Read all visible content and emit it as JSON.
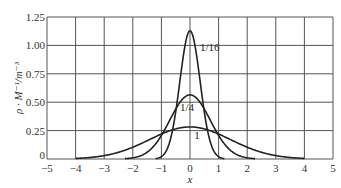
{
  "chart_data": {
    "type": "line",
    "title": "",
    "xlabel": "x",
    "ylabel": "ρ · M⁻¹/m⁻³",
    "xlim": [
      -5,
      5
    ],
    "ylim": [
      0,
      1.25
    ],
    "grid": true,
    "x_ticks": [
      "−5",
      "−4",
      "−3",
      "−2",
      "−1",
      "0",
      "1",
      "2",
      "3",
      "4",
      "5"
    ],
    "y_ticks": [
      "0",
      "0.25",
      "0.50",
      "0.75",
      "1.00",
      "1.25"
    ],
    "x": [
      -4,
      -3.5,
      -3,
      -2.5,
      -2,
      -1.75,
      -1.5,
      -1.25,
      -1,
      -0.75,
      -0.5,
      -0.25,
      0,
      0.25,
      0.5,
      0.75,
      1,
      1.25,
      1.5,
      1.75,
      2,
      2.5,
      3,
      3.5,
      4
    ],
    "series": [
      {
        "name": "1/16",
        "label": "1/16",
        "peak": 1.13,
        "values": [
          0,
          0,
          0,
          0,
          0,
          0,
          0,
          0.001,
          0.02,
          0.12,
          0.41,
          0.83,
          1.13,
          0.83,
          0.41,
          0.12,
          0.02,
          0.001,
          0,
          0,
          0,
          0,
          0,
          0,
          0
        ]
      },
      {
        "name": "1/4",
        "label": "1/4",
        "peak": 0.56,
        "values": [
          0,
          0,
          0,
          0.002,
          0.01,
          0.027,
          0.06,
          0.12,
          0.21,
          0.32,
          0.44,
          0.53,
          0.56,
          0.53,
          0.44,
          0.32,
          0.21,
          0.12,
          0.06,
          0.027,
          0.01,
          0.002,
          0,
          0,
          0
        ]
      },
      {
        "name": "1",
        "label": "1",
        "peak": 0.28,
        "values": [
          0.005,
          0.013,
          0.03,
          0.06,
          0.1,
          0.13,
          0.16,
          0.19,
          0.22,
          0.25,
          0.26,
          0.28,
          0.28,
          0.28,
          0.26,
          0.25,
          0.22,
          0.19,
          0.16,
          0.13,
          0.1,
          0.06,
          0.03,
          0.013,
          0.005
        ]
      }
    ],
    "annotations": [
      {
        "text": "1/16",
        "x": 0.35,
        "y": 0.95
      },
      {
        "text": "1/4",
        "x": -0.35,
        "y": 0.42
      },
      {
        "text": "1",
        "x": 0.15,
        "y": 0.18
      }
    ]
  }
}
